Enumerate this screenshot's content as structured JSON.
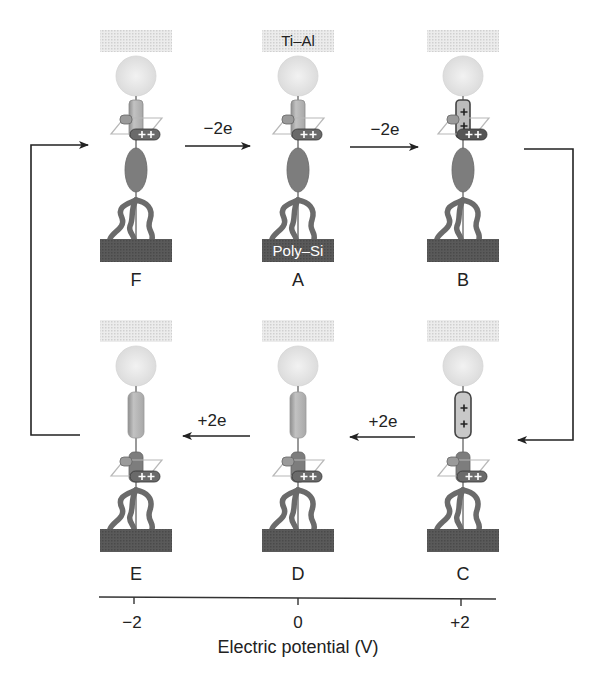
{
  "figure": {
    "top_electrode_label": "Ti–Al",
    "bottom_electrode_label": "Poly–Si",
    "states": [
      {
        "id": "F",
        "label": "F",
        "row": "top",
        "cx": 136,
        "ring_position": "upper",
        "rod_charges": 0,
        "ring_charges": 2
      },
      {
        "id": "A",
        "label": "A",
        "row": "top",
        "cx": 298,
        "ring_position": "upper",
        "rod_charges": 0,
        "ring_charges": 2
      },
      {
        "id": "B",
        "label": "B",
        "row": "top",
        "cx": 463,
        "ring_position": "upper",
        "rod_charges": 2,
        "ring_charges": 2
      },
      {
        "id": "E",
        "label": "E",
        "row": "bottom",
        "cx": 136,
        "ring_position": "lower",
        "rod_charges": 0,
        "ring_charges": 2
      },
      {
        "id": "D",
        "label": "D",
        "row": "bottom",
        "cx": 298,
        "ring_position": "lower",
        "rod_charges": 0,
        "ring_charges": 2
      },
      {
        "id": "C",
        "label": "C",
        "row": "bottom",
        "cx": 463,
        "ring_position": "lower",
        "rod_charges": 2,
        "ring_charges": 2
      }
    ],
    "transitions": [
      {
        "from": "F",
        "to": "A",
        "label": "−2e"
      },
      {
        "from": "A",
        "to": "B",
        "label": "−2e"
      },
      {
        "from": "C",
        "to": "D",
        "label": "+2e"
      },
      {
        "from": "D",
        "to": "E",
        "label": "+2e"
      },
      {
        "from": "B",
        "to": "C",
        "label": ""
      },
      {
        "from": "E",
        "to": "F",
        "label": ""
      }
    ],
    "arrow_labels": {
      "f_to_a": "−2e",
      "a_to_b": "−2e",
      "c_to_d": "+2e",
      "d_to_e": "+2e"
    },
    "state_labels": {
      "F": "F",
      "A": "A",
      "B": "B",
      "E": "E",
      "D": "D",
      "C": "C"
    },
    "axis": {
      "title": "Electric potential (V)",
      "ticks": [
        {
          "value": -2,
          "label": "−2",
          "state": "E"
        },
        {
          "value": 0,
          "label": "0",
          "state": "D"
        },
        {
          "value": 2,
          "label": "+2",
          "state": "C"
        }
      ]
    },
    "colors": {
      "electrode_top": "#d9d9d9",
      "stopper_sphere": "#e6e6e6",
      "rod": "#b5b5b5",
      "ring": "#8a8a8a",
      "ring_dark": "#5a5a5a",
      "ellipse": "#7d7d7d",
      "legs": "#6b6b6b",
      "electrode_bottom": "#5c5c5c",
      "line": "#222222"
    }
  }
}
